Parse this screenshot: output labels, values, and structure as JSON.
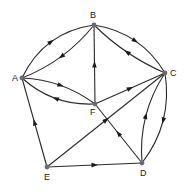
{
  "diagram": {
    "type": "directed-graph",
    "nodes": [
      {
        "id": "A",
        "label": "A",
        "x": 22,
        "y": 78,
        "lx": 12,
        "ly": 81
      },
      {
        "id": "B",
        "label": "B",
        "x": 94,
        "y": 25,
        "lx": 90,
        "ly": 18
      },
      {
        "id": "C",
        "label": "C",
        "x": 165,
        "y": 73,
        "lx": 170,
        "ly": 76
      },
      {
        "id": "D",
        "label": "D",
        "x": 142,
        "y": 163,
        "lx": 140,
        "ly": 176
      },
      {
        "id": "E",
        "label": "E",
        "x": 47,
        "y": 167,
        "lx": 44,
        "ly": 180
      },
      {
        "id": "F",
        "label": "F",
        "x": 95,
        "y": 104,
        "lx": 90,
        "ly": 115
      }
    ],
    "edges": [
      {
        "from": "A",
        "to": "B",
        "curve": -12
      },
      {
        "from": "B",
        "to": "A",
        "curve": -6
      },
      {
        "from": "B",
        "to": "C",
        "curve": -10
      },
      {
        "from": "C",
        "to": "B",
        "curve": -4
      },
      {
        "from": "A",
        "to": "F",
        "curve": -6
      },
      {
        "from": "F",
        "to": "A",
        "curve": -8
      },
      {
        "from": "F",
        "to": "B",
        "curve": 0
      },
      {
        "from": "F",
        "to": "C",
        "curve": 0
      },
      {
        "from": "C",
        "to": "D",
        "curve": -10
      },
      {
        "from": "D",
        "to": "C",
        "curve": -8
      },
      {
        "from": "D",
        "to": "F",
        "curve": 0
      },
      {
        "from": "E",
        "to": "A",
        "curve": 0
      },
      {
        "from": "E",
        "to": "C",
        "curve": 0
      },
      {
        "from": "E",
        "to": "D",
        "curve": 0
      }
    ]
  }
}
